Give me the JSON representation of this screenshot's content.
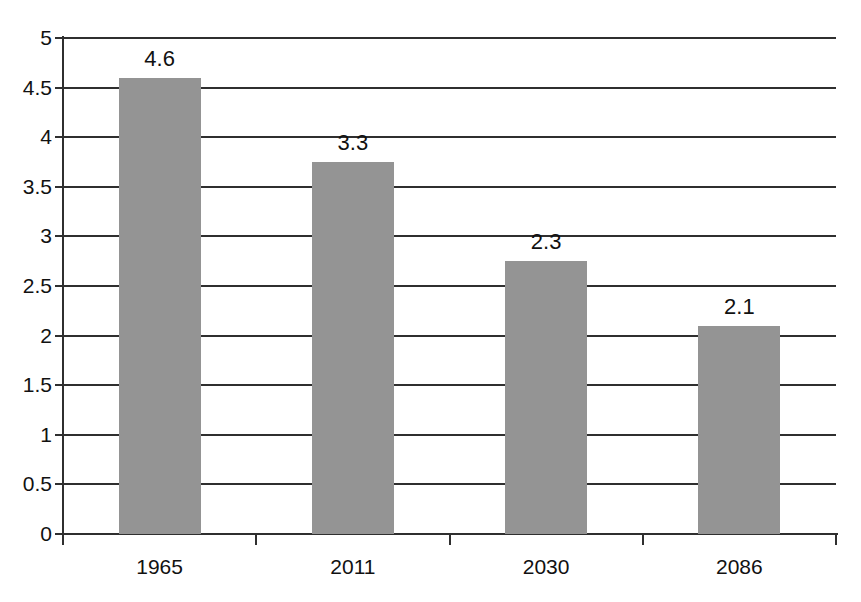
{
  "chart_data": {
    "type": "bar",
    "title": "",
    "subtitle": "",
    "xlabel": "",
    "ylabel": "",
    "categories": [
      "1965",
      "2011",
      "2030",
      "2086"
    ],
    "values": [
      4.6,
      3.3,
      2.3,
      2.1
    ],
    "bar_plotted_heights": [
      4.6,
      3.75,
      2.75,
      2.1
    ],
    "data_labels": [
      "4.6",
      "3.3",
      "2.3",
      "2.1"
    ],
    "ylim": [
      0,
      5
    ],
    "ytick_step": 0.5,
    "ytick_labels": [
      "5",
      "4.5",
      "4",
      "3.5",
      "3",
      "2.5",
      "2",
      "1.5",
      "1",
      "0.5",
      "0"
    ],
    "ytick_values": [
      5,
      4.5,
      4,
      3.5,
      3,
      2.5,
      2,
      1.5,
      1,
      0.5,
      0
    ],
    "grid": true,
    "grid_axis": "y",
    "legend": false,
    "legend_position": "none",
    "bar_color": "#949494",
    "axis_color": "#2f2f2f",
    "text_color": "#111111",
    "background_color": "#ffffff"
  }
}
